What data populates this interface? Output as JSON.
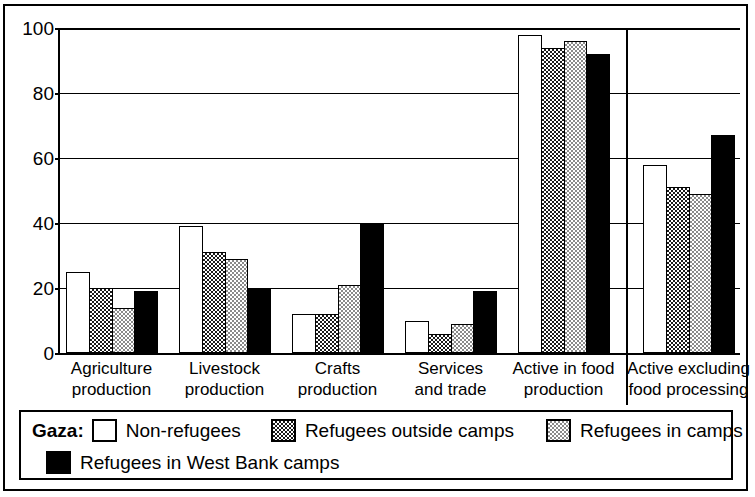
{
  "chart_data": {
    "type": "bar",
    "title": "",
    "xlabel": "",
    "ylabel": "",
    "ylim": [
      0,
      100
    ],
    "yticks": [
      0,
      20,
      40,
      60,
      80,
      100
    ],
    "grid": true,
    "legend_position": "bottom",
    "categories": [
      "Agriculture production",
      "Livestock production",
      "Crafts production",
      "Services and trade",
      "Active in food production",
      "Active excluding food processing"
    ],
    "category_lines": [
      [
        "Agriculture",
        "production"
      ],
      [
        "Livestock",
        "production"
      ],
      [
        "Crafts",
        "production"
      ],
      [
        "Services",
        "and trade"
      ],
      [
        "Active in food",
        "production"
      ],
      [
        "Active excluding",
        "food processing"
      ]
    ],
    "series": [
      {
        "name": "Non-refugees",
        "fill": "white",
        "values": [
          25,
          39,
          12,
          10,
          98,
          58
        ]
      },
      {
        "name": "Refugees outside camps",
        "fill": "darkgray",
        "values": [
          20,
          31,
          12,
          6,
          94,
          51
        ]
      },
      {
        "name": "Refugees in camps",
        "fill": "lightgray",
        "values": [
          14,
          29,
          21,
          9,
          96,
          49
        ]
      },
      {
        "name": "Refugees in West Bank camps",
        "fill": "black",
        "values": [
          19,
          20,
          40,
          19,
          92,
          67
        ]
      }
    ],
    "annotations": {
      "group_divider_after_category_index": 4
    }
  },
  "legend": {
    "title": "Gaza:",
    "entries": [
      {
        "label": "Non-refugees",
        "fill": "white"
      },
      {
        "label": "Refugees outside camps",
        "fill": "darkgray"
      },
      {
        "label": "Refugees in camps",
        "fill": "lightgray"
      },
      {
        "label": "Refugees in West Bank camps",
        "fill": "black"
      }
    ]
  },
  "colors": {
    "axis": "#000000",
    "frame": "#000000",
    "background": "#ffffff",
    "series_white": "#ffffff",
    "series_darkgray": "#1a1a1a",
    "series_lightgray": "#8a8a8a",
    "series_black": "#000000"
  }
}
